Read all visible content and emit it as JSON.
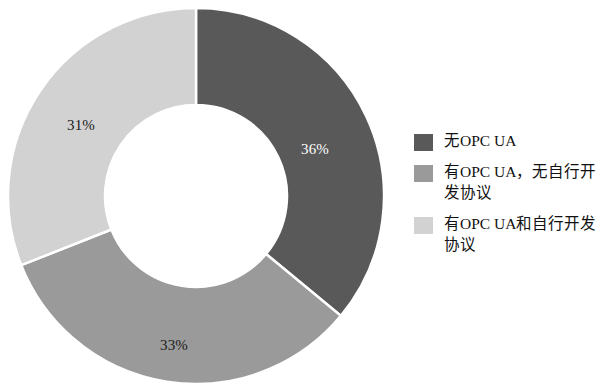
{
  "chart_data": {
    "type": "pie",
    "variant": "donut",
    "title": "",
    "subtitle": "",
    "xlabel": "",
    "ylabel": "",
    "grid": false,
    "legend_position": "right",
    "start_angle_deg": 0,
    "direction": "clockwise",
    "inner_radius_ratio": 0.484,
    "categories": [
      "无OPC UA",
      "有OPC UA，无自行开发协议",
      "有OPC UA和自行开发协议"
    ],
    "values": [
      36,
      33,
      31
    ],
    "value_unit": "%",
    "data_labels": [
      "36%",
      "33%",
      "31%"
    ],
    "colors": [
      "#595959",
      "#9a9a9a",
      "#d2d2d2"
    ],
    "label_colors": [
      "#ffffff",
      "#1c1c1c",
      "#1c1c1c"
    ]
  },
  "chart": {
    "geometry": {
      "center_x": 196,
      "center_y": 196,
      "outer_radius": 188,
      "inner_radius": 91
    },
    "slices": [
      {
        "name": "无OPC UA",
        "value": 36,
        "label": "36%",
        "color": "#595959",
        "label_color": "#ffffff",
        "label_x": 315,
        "label_y": 149
      },
      {
        "name": "有OPC UA，无自行开发协议",
        "value": 33,
        "label": "33%",
        "color": "#9a9a9a",
        "label_color": "#1c1c1c",
        "label_x": 174,
        "label_y": 345
      },
      {
        "name": "有OPC UA和自行开发协议",
        "value": 31,
        "label": "31%",
        "color": "#d2d2d2",
        "label_color": "#1c1c1c",
        "label_x": 81,
        "label_y": 125
      }
    ]
  },
  "legend": {
    "items": [
      {
        "label": "无OPC UA",
        "color": "#595959"
      },
      {
        "label": "有OPC UA，无自行开发协议",
        "color": "#9a9a9a"
      },
      {
        "label": "有OPC UA和自行开发协议",
        "color": "#d2d2d2"
      }
    ]
  }
}
